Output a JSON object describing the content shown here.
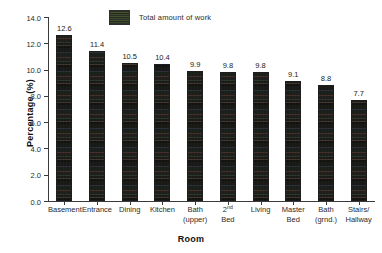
{
  "chart_data": {
    "type": "bar",
    "title": "",
    "xlabel": "Room",
    "ylabel": "Percentage (%)",
    "ylim": [
      0.0,
      14.0
    ],
    "ytick_step": 2.0,
    "ytick_labels": [
      "0.0",
      "2.0",
      "4.0",
      "6.0",
      "8.0",
      "10.0",
      "12.0",
      "14.0"
    ],
    "ytick_values": [
      0.0,
      2.0,
      4.0,
      6.0,
      8.0,
      10.0,
      12.0,
      14.0
    ],
    "grid": false,
    "legend_position": "top-center",
    "legend": [
      {
        "label": "Total amount of work",
        "swatch": "dark-textured-fill"
      }
    ],
    "categories": [
      "Basement",
      "Entrance",
      "Dining",
      "Kitchen",
      "Bath (upper)",
      "2nd Bed",
      "Living",
      "Master Bed",
      "Bath (grnd.)",
      "Stairs/ Hallway"
    ],
    "category_lines": [
      {
        "line1": "Basement",
        "line2": "",
        "sup": ""
      },
      {
        "line1": "Entrance",
        "line2": "",
        "sup": ""
      },
      {
        "line1": "Dining",
        "line2": "",
        "sup": ""
      },
      {
        "line1": "Kitchen",
        "line2": "",
        "sup": ""
      },
      {
        "line1": "Bath",
        "line2": "(upper)",
        "sup": ""
      },
      {
        "line1": "2",
        "line2": "Bed",
        "sup": "nd"
      },
      {
        "line1": "Living",
        "line2": "",
        "sup": ""
      },
      {
        "line1": "Master",
        "line2": "Bed",
        "sup": ""
      },
      {
        "line1": "Bath",
        "line2": "(grnd.)",
        "sup": ""
      },
      {
        "line1": "Stairs/",
        "line2": "Hallway",
        "sup": ""
      }
    ],
    "values": [
      12.6,
      11.4,
      10.5,
      10.4,
      9.9,
      9.8,
      9.8,
      9.1,
      8.8,
      7.7
    ],
    "value_labels": [
      "12.6",
      "11.4",
      "10.5",
      "10.4",
      "9.9",
      "9.8",
      "9.8",
      "9.1",
      "8.8",
      "7.7"
    ],
    "series": [
      {
        "name": "Total amount of work",
        "values": [
          12.6,
          11.4,
          10.5,
          10.4,
          9.9,
          9.8,
          9.8,
          9.1,
          8.8,
          7.7
        ]
      }
    ],
    "colors": {
      "bar_fill": "#2b2b26",
      "bar_edge": "#1d1d1d",
      "axis": "#3a3a3a",
      "text": "#2a2a2a",
      "background": "#ffffff"
    }
  }
}
